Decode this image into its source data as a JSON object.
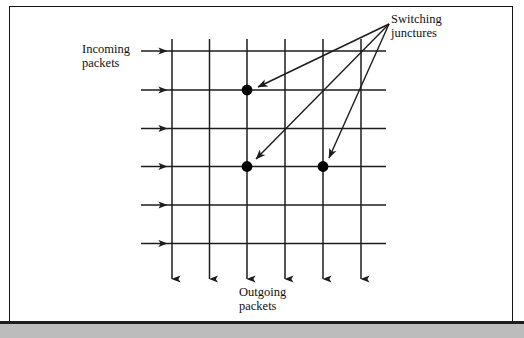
{
  "figure": {
    "labels": {
      "incoming": "Incoming\npackets",
      "outgoing": "Outgoing\npackets",
      "switching": "Switching\njunctures"
    },
    "colors": {
      "line": "#1c1c1c",
      "frame": "#141414",
      "page_background": "#ffffff",
      "shadow_strip": "#bcbcbc",
      "junction_dot": "#000000"
    }
  },
  "diagram_data": {
    "type": "grid-flow",
    "columns": {
      "count": 6,
      "x": [
        171,
        208.5,
        246,
        284,
        322,
        360
      ],
      "y_top": 38,
      "y_arrow_tip": 279,
      "direction": "down",
      "meaning": "outgoing packet buses"
    },
    "rows": {
      "count": 6,
      "y": [
        50,
        89,
        127.5,
        165.5,
        204,
        242.5
      ],
      "x_start": 140,
      "x_arrow_tip": 166,
      "x_end": 385,
      "direction": "right",
      "meaning": "incoming packet buses"
    },
    "junctions": [
      {
        "id": "junction-1",
        "column": 3,
        "row": 2,
        "x": 246,
        "y": 89,
        "radius": 5.2
      },
      {
        "id": "junction-2",
        "column": 3,
        "row": 4,
        "x": 246,
        "y": 165.5,
        "radius": 5.2
      },
      {
        "id": "junction-3",
        "column": 5,
        "row": 4,
        "x": 322,
        "y": 165.5,
        "radius": 5.2
      }
    ],
    "callout": {
      "origin": {
        "x": 388,
        "y": 23
      },
      "targets": [
        "junction-1",
        "junction-2",
        "junction-3"
      ],
      "arrow_head_length": 9,
      "label": "Switching junctures"
    }
  }
}
